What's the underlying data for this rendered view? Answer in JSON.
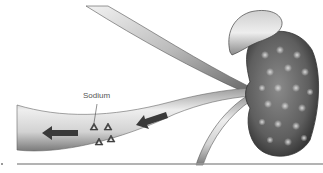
{
  "diagram": {
    "labels": {
      "sodium": "Sodium"
    },
    "elements": {
      "vessel": "blood-vessel",
      "kidney": "kidney",
      "adrenal": "adrenal-gland",
      "arrows": [
        "flow-arrow-left",
        "flow-arrow-right"
      ],
      "particles": [
        "sodium-triangle",
        "sodium-triangle",
        "sodium-triangle",
        "sodium-triangle"
      ]
    },
    "colors": {
      "vessel_light": "#e6e6e6",
      "vessel_dark": "#8a8a8a",
      "kidney_dark": "#4a4a4a",
      "kidney_mid": "#777777",
      "arrow": "#3a3a3a",
      "baseline": "#9a9a9a"
    }
  }
}
